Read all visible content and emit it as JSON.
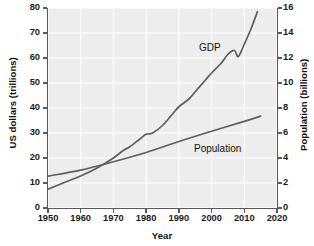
{
  "chart_data": {
    "type": "line",
    "title": "",
    "xlabel": "Year",
    "ylabel": "US dollars (trillions)",
    "ylabel_right": "Population (billions)",
    "xlim": [
      1950,
      2020
    ],
    "ylim": [
      0,
      80
    ],
    "ylim_right": [
      0,
      16
    ],
    "grid": true,
    "grid_color": "#ffffff",
    "plot_background": "#ededed",
    "legend": "inline-annotations",
    "xticks": [
      1950,
      1960,
      1970,
      1980,
      1990,
      2000,
      2010,
      2020
    ],
    "xticklabels": [
      "1950",
      "1960",
      "1970",
      "1980",
      "1990",
      "2000",
      "2010",
      "2020"
    ],
    "yticks_left": [
      0,
      10,
      20,
      30,
      40,
      50,
      60,
      70,
      80
    ],
    "yticklabels_left": [
      "0",
      "10",
      "20",
      "30",
      "40",
      "50",
      "60",
      "70",
      "80"
    ],
    "yticks_right": [
      0,
      2,
      4,
      6,
      8,
      10,
      12,
      14,
      16
    ],
    "yticklabels_right": [
      "0",
      "2",
      "4",
      "6",
      "8",
      "10",
      "12",
      "14",
      "16"
    ],
    "series": [
      {
        "name": "GDP",
        "axis": "left",
        "units": "US dollars (trillions)",
        "color": "#5e5e5e",
        "x": [
          1950,
          1955,
          1960,
          1965,
          1970,
          1973,
          1975,
          1978,
          1980,
          1982,
          1985,
          1988,
          1990,
          1993,
          1995,
          1998,
          2000,
          2003,
          2005,
          2007,
          2008,
          2009,
          2010,
          2012,
          2014
        ],
        "y": [
          7.5,
          10.2,
          12.8,
          16.0,
          20.0,
          23.0,
          24.5,
          27.5,
          29.5,
          30.0,
          33.0,
          37.5,
          40.5,
          43.5,
          46.5,
          51.0,
          54.0,
          58.0,
          61.5,
          63.0,
          60.5,
          62.5,
          65.5,
          71.5,
          78.5
        ]
      },
      {
        "name": "Population",
        "axis": "right",
        "units": "billions",
        "color": "#5e5e5e",
        "x": [
          1950,
          1960,
          1970,
          1980,
          1990,
          2000,
          2010,
          2015
        ],
        "y": [
          2.55,
          3.03,
          3.7,
          4.44,
          5.32,
          6.14,
          6.93,
          7.35
        ]
      }
    ],
    "annotations": [
      {
        "text": "GDP",
        "x": 2002,
        "y": 63
      },
      {
        "text": "Population",
        "x": 1996,
        "y": 24
      }
    ]
  },
  "axes": {
    "x_title": "Year",
    "y_left_title": "US dollars (trillions)",
    "y_right_title": "Population (billions)"
  }
}
